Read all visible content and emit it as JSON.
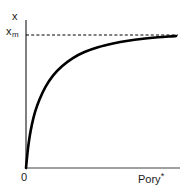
{
  "chart_data": {
    "type": "line",
    "title": "",
    "subtitle": "",
    "xlabel": "Pory*",
    "ylabel": "x",
    "xlabel_base": "Pory",
    "xlabel_superscript": "*",
    "ylabel_asymptote_base": "x",
    "ylabel_asymptote_subscript": "m",
    "ylabel_asymptote": "xm",
    "origin_label": "0",
    "xlim": [
      0,
      1
    ],
    "ylim": [
      0,
      1.06
    ],
    "grid": false,
    "legend": null,
    "axis_color": "#808080",
    "curve_color": "#000000",
    "asymptote_color": "#000000",
    "asymptote_style": "dashed",
    "asymptote_value": 1.0,
    "annotations": [
      {
        "name": "asymptote-line",
        "text": "",
        "description": "horizontal dashed line at x_m marking the saturation plateau"
      }
    ],
    "series": [
      {
        "name": "adsorption-isotherm",
        "x": [
          0.0,
          0.012,
          0.025,
          0.04,
          0.06,
          0.09,
          0.13,
          0.18,
          0.24,
          0.31,
          0.39,
          0.48,
          0.58,
          0.68,
          0.78,
          0.88,
          0.97,
          1.0
        ],
        "y": [
          0.0,
          0.135,
          0.24,
          0.33,
          0.42,
          0.515,
          0.61,
          0.695,
          0.765,
          0.825,
          0.872,
          0.908,
          0.936,
          0.957,
          0.972,
          0.983,
          0.99,
          0.992
        ]
      }
    ],
    "xticks": [],
    "yticks": [],
    "xticklabels": [],
    "yticklabels": []
  }
}
